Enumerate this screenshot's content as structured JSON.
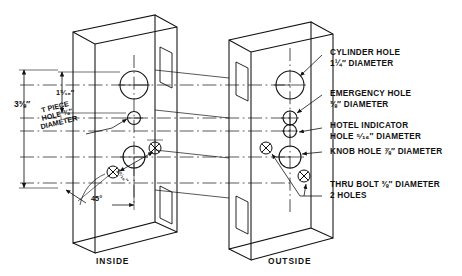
{
  "drawing": {
    "title": "Door Preparation Detail",
    "views": [
      {
        "key": "inside",
        "caption": "INSIDE"
      },
      {
        "key": "outside",
        "caption": "OUTSIDE"
      }
    ],
    "dimensions": {
      "overall_vertical": "3⅜″",
      "top_to_cylinder": "1⁵⁄₁₆″",
      "bolt_spacing": "1⁵⁄₁₆″",
      "angle": "45°"
    },
    "inside_labels": {
      "tpiece_line1": "T PIECE",
      "tpiece_line2": "HOLE ⅜″",
      "tpiece_line3": "DIAMETER"
    },
    "callouts": [
      {
        "id": "cylinder-hole",
        "line1": "CYLINDER HOLE",
        "line2": "1¼″ DIAMETER"
      },
      {
        "id": "emergency-hole",
        "line1": "EMERGENCY HOLE",
        "line2": "⅜″ DIAMETER"
      },
      {
        "id": "hotel-indicator-hole",
        "line1": "HOTEL INDICATOR",
        "line2": "HOLE ⁵⁄₁₆″ DIAMETER"
      },
      {
        "id": "knob-hole",
        "line1": "KNOB HOLE ⅞″ DIAMETER",
        "line2": ""
      },
      {
        "id": "thru-bolt",
        "line1": "THRU BOLT ⅜″ DIAMETER",
        "line2": "2 HOLES"
      }
    ],
    "colors": {
      "line": "#111111",
      "background": "#ffffff"
    }
  }
}
